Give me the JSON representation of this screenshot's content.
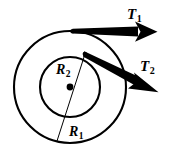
{
  "figure": {
    "background_color": "#ffffff",
    "stroke_color": "#000000",
    "width": 173,
    "height": 153
  },
  "geometry": {
    "center": {
      "x": 70,
      "y": 87
    },
    "outer_radius": 56,
    "inner_radius": 30,
    "hub_dot_radius": 3.4
  },
  "labels": {
    "T1": {
      "base": "T",
      "sub": "1"
    },
    "T2": {
      "base": "T",
      "sub": "2"
    },
    "R1": {
      "base": "R",
      "sub": "1"
    },
    "R2": {
      "base": "R",
      "sub": "2"
    }
  },
  "forces": [
    {
      "name": "T1",
      "applied_at_radius": "outer_radius",
      "start": {
        "x": 72,
        "y": 31
      },
      "end": {
        "x": 157,
        "y": 32
      },
      "direction": "right"
    },
    {
      "name": "T2",
      "applied_at_radius": "inner_radius",
      "start": {
        "x": 85,
        "y": 54
      },
      "end": {
        "x": 158,
        "y": 92
      },
      "direction": "down-right"
    }
  ],
  "radius_line": {
    "name": "radius-line",
    "from": {
      "x": 85,
      "y": 54
    },
    "to": {
      "x": 57,
      "y": 141
    }
  }
}
